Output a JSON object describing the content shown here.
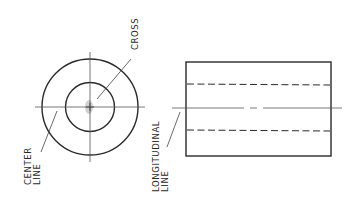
{
  "diagram": {
    "title": "",
    "type": "orthographic-projection",
    "views": [
      {
        "name": "end-view",
        "description": "Two concentric circles with crossing center lines"
      },
      {
        "name": "side-view",
        "description": "Rectangle with two hidden (dashed) lines and a longitudinal center line"
      }
    ],
    "labels": {
      "cross": "CROSS",
      "center_line_1": "CENTER",
      "center_line_2": "LINE",
      "longitudinal_line_1": "LONGITUDINAL",
      "longitudinal_line_2": "LINE"
    },
    "colors": {
      "line": "#2a2a2a",
      "thin_line": "#555555",
      "highlight": "#c8c8c8",
      "background": "#ffffff"
    }
  }
}
